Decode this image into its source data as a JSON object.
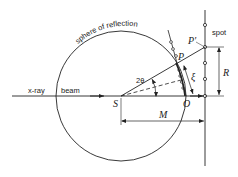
{
  "diagram": {
    "type": "ewald-sphere-geometry",
    "labels": {
      "sphere": "sphere of reflection",
      "xray": "x-ray",
      "beam": "beam",
      "spot": "spot",
      "S": "S",
      "O": "O",
      "P": "P",
      "P_prime": "P'",
      "R": "R",
      "M": "M",
      "xi": "ξ",
      "two_theta": "2θ"
    },
    "colors": {
      "line": "#222222",
      "background": "#ffffff"
    }
  }
}
